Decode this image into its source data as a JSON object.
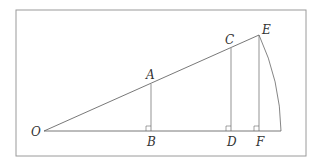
{
  "diagram": {
    "colors": {
      "line": "#555555",
      "frame": "#9a9a9a",
      "text": "#333333"
    },
    "points": {
      "O": {
        "label": "O",
        "x": 44,
        "y": 131
      },
      "A": {
        "label": "A",
        "x": 151,
        "y": 84
      },
      "B": {
        "label": "B",
        "x": 151,
        "y": 131
      },
      "C": {
        "label": "C",
        "x": 231,
        "y": 48
      },
      "D": {
        "label": "D",
        "x": 231,
        "y": 131
      },
      "E": {
        "label": "E",
        "x": 259,
        "y": 35
      },
      "F": {
        "label": "F",
        "x": 259,
        "y": 131
      }
    },
    "labels": {
      "O": "O",
      "A": "A",
      "B": "B",
      "C": "C",
      "D": "D",
      "E": "E",
      "F": "F"
    }
  }
}
